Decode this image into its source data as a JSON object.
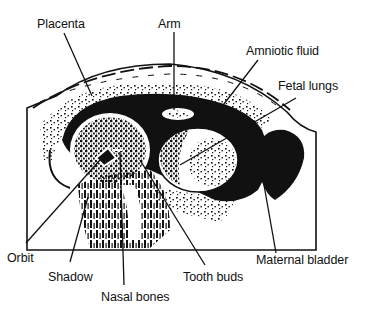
{
  "diagram": {
    "type": "ultrasound-illustration",
    "colors": {
      "ink": "#111111",
      "background": "#ffffff"
    },
    "labels": {
      "placenta": "Placenta",
      "arm": "Arm",
      "amniotic_fluid": "Amniotic fluid",
      "fetal_lungs": "Fetal lungs",
      "maternal_bladder": "Maternal bladder",
      "orbit": "Orbit",
      "shadow": "Shadow",
      "tooth_buds": "Tooth buds",
      "nasal_bones": "Nasal bones"
    }
  }
}
